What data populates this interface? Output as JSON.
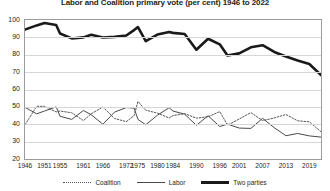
{
  "chart_data": {
    "type": "line",
    "title": "Labor and Coalition primary vote (per cent) 1946 to 2022",
    "xlabel": "",
    "ylabel": "",
    "ylim": [
      20,
      100
    ],
    "yticks": [
      20,
      30,
      40,
      50,
      60,
      70,
      80,
      90,
      100
    ],
    "grid": true,
    "legend_position": "bottom",
    "x": [
      1946,
      1949,
      1951,
      1954,
      1955,
      1958,
      1961,
      1963,
      1966,
      1969,
      1972,
      1974,
      1975,
      1977,
      1980,
      1983,
      1984,
      1987,
      1990,
      1993,
      1996,
      1998,
      2001,
      2004,
      2007,
      2010,
      2013,
      2016,
      2019,
      2022
    ],
    "xtick_labels": [
      "1946",
      "1951",
      "1955",
      "1961",
      "1966",
      "1972",
      "1975",
      "1980",
      "1984",
      "1990",
      "1996",
      "2001",
      "2007",
      "2013",
      "2019"
    ],
    "xticks": [
      1946,
      1951,
      1955,
      1961,
      1966,
      1972,
      1975,
      1980,
      1984,
      1990,
      1996,
      2001,
      2007,
      2013,
      2019
    ],
    "series": [
      {
        "name": "Coalition",
        "style": "dotted",
        "color": "#555555",
        "values": [
          39.7,
          50.3,
          50.3,
          47.1,
          47.6,
          46.6,
          42.1,
          46.0,
          49.9,
          43.3,
          41.5,
          44.9,
          53.1,
          48.1,
          46.4,
          43.6,
          45.0,
          46.1,
          43.5,
          44.3,
          47.3,
          39.5,
          43.0,
          46.7,
          42.1,
          43.6,
          45.6,
          42.0,
          41.4,
          35.7
        ],
        "dash": "1.6,1.6",
        "width": 1.0
      },
      {
        "name": "Labor",
        "style": "solid-thin",
        "color": "#4a4a4a",
        "values": [
          49.7,
          46.0,
          47.6,
          50.0,
          44.6,
          42.8,
          47.9,
          45.5,
          40.0,
          47.0,
          49.6,
          49.3,
          42.8,
          39.7,
          45.2,
          49.5,
          47.6,
          45.8,
          39.4,
          44.9,
          38.7,
          40.1,
          37.8,
          37.6,
          43.4,
          38.0,
          33.4,
          34.7,
          33.3,
          32.6
        ],
        "width": 1.0
      },
      {
        "name": "Two parties",
        "style": "solid-thick",
        "color": "#1a1a1a",
        "values": [
          94.5,
          96.9,
          98.3,
          97.1,
          92.2,
          89.4,
          90.0,
          91.5,
          89.9,
          90.3,
          91.1,
          94.2,
          95.9,
          87.8,
          91.6,
          93.1,
          92.6,
          91.9,
          82.9,
          89.2,
          86.0,
          79.6,
          80.8,
          84.3,
          85.5,
          81.6,
          79.0,
          76.7,
          74.7,
          68.3
        ]
      }
    ]
  },
  "legend": {
    "items": [
      {
        "label": "Coalition",
        "swatch": "dotted-line-swatch"
      },
      {
        "label": "Labor",
        "swatch": "thin-line-swatch"
      },
      {
        "label": "Two parties",
        "swatch": "thick-line-swatch"
      }
    ]
  }
}
